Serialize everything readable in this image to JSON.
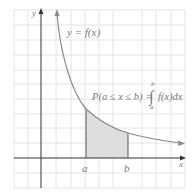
{
  "diagram": {
    "curve_label": "y = f(x)",
    "formula": {
      "lhs": "P(a ≤ x ≤ b) =",
      "integral_upper": "b",
      "integral_lower": "a",
      "integrand": "f(x)dx"
    },
    "axes": {
      "x_label": "x",
      "y_label": "y"
    },
    "markers": [
      {
        "label": "a"
      },
      {
        "label": "b"
      }
    ],
    "colors": {
      "grid": "#e4e4e4",
      "axes": "#333333",
      "curve": "#8a8a8a",
      "shade": "#dedede",
      "text": "#7a7a7a"
    }
  }
}
